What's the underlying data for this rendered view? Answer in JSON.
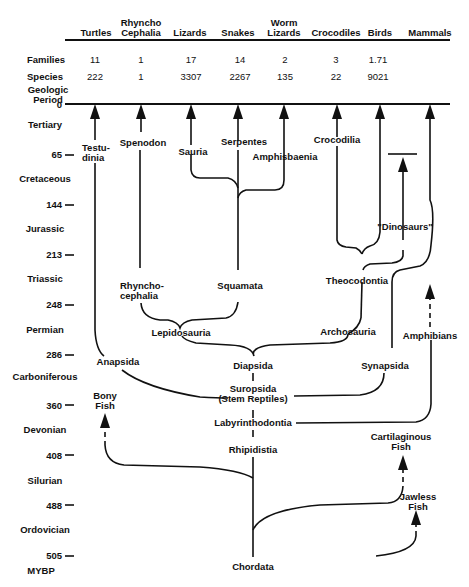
{
  "columns": [
    {
      "name": "Turtles",
      "families": "11",
      "species": "222"
    },
    {
      "name": "Rhyncho Cephalia",
      "families": "1",
      "species": "1"
    },
    {
      "name": "Lizards",
      "families": "17",
      "species": "3307"
    },
    {
      "name": "Snakes",
      "families": "14",
      "species": "2267"
    },
    {
      "name": "Worm Lizards",
      "families": "2",
      "species": "135"
    },
    {
      "name": "Crocodiles",
      "families": "3",
      "species": "22"
    },
    {
      "name": "Birds",
      "families": "1.71",
      "species": "9021"
    },
    {
      "name": "Mammals",
      "families": "",
      "species": ""
    }
  ],
  "row_labels": {
    "families": "Families",
    "species": "Species",
    "period_title": "Geologic Period",
    "unit": "MYBP"
  },
  "timescale": {
    "ticks": [
      "0",
      "65",
      "144",
      "213",
      "248",
      "286",
      "360",
      "408",
      "488",
      "505"
    ],
    "periods": [
      "Tertiary",
      "Cretaceous",
      "Jurassic",
      "Triassic",
      "Permian",
      "Carboniferous",
      "Devonian",
      "Silurian",
      "Ordovician"
    ]
  },
  "taxa": {
    "testudinia": "Testu-\ndinia",
    "spenodon": "Spenodon",
    "sauria": "Sauria",
    "serpentes": "Serpentes",
    "amphisbaenia": "Amphisbaenia",
    "crocodilia": "Crocodilia",
    "dinosaurs": "\"Dinosaurs\"",
    "rhynchocephalia": "Rhyncho-\ncephalia",
    "squamata": "Squamata",
    "theocodontia": "Theocodontia",
    "lepidosauria": "Lepidosauria",
    "archosauria": "Archosauria",
    "amphibians": "Amphibians",
    "anapsida": "Anapsida",
    "diapsida": "Diapsida",
    "synapsida": "Synapsida",
    "suropsida": "Suropsida",
    "stem_reptiles": "(Stem Reptiles)",
    "bony_fish": "Bony\nFish",
    "labyrinthodontia": "Labyrinthodontia",
    "cartilaginous_fish": "Cartilaginous\nFish",
    "rhipidistia": "Rhipidistia",
    "jawless_fish": "Jawless\nFish",
    "chordata": "Chordata"
  }
}
